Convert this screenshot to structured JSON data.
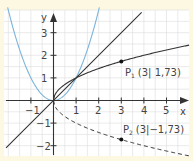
{
  "chart_data": {
    "type": "line",
    "title": "",
    "xlabel": "x",
    "ylabel": "y",
    "xlim": [
      -2.2,
      5.9
    ],
    "ylim": [
      -2.4,
      3.9
    ],
    "grid": true,
    "x_ticks": [
      -1,
      1,
      2,
      3,
      4,
      5
    ],
    "x_tick_labels": [
      "−1",
      "1",
      "2",
      "3",
      "4",
      "5"
    ],
    "y_ticks": [
      3,
      2,
      1,
      -1,
      -2
    ],
    "y_tick_labels": [
      "3",
      "2",
      "1",
      "−1",
      "−2"
    ],
    "series": [
      {
        "name": "y = x²",
        "color": "#7ab4dc",
        "style": "solid",
        "expr": "x^2"
      },
      {
        "name": "y = x",
        "color": "#333333",
        "style": "solid",
        "expr": "x"
      },
      {
        "name": "y = √x",
        "color": "#333333",
        "style": "solid",
        "expr": "sqrt(x)"
      },
      {
        "name": "y = −√x",
        "color": "#333333",
        "style": "dashed",
        "expr": "-sqrt(x)"
      }
    ],
    "points": [
      {
        "name": "P1",
        "x": 3,
        "y": 1.73,
        "label": "(3| 1,73)"
      },
      {
        "name": "P2",
        "x": 3,
        "y": -1.73,
        "label": "(3|−1,73)"
      }
    ]
  },
  "labels": {
    "x_axis": "x",
    "y_axis": "y",
    "p1_name": "P",
    "p1_sub": "1",
    "p1_coords": "(3| 1,73)",
    "p2_name": "P",
    "p2_sub": "2",
    "p2_coords": "(3|−1,73)",
    "ticks_x": [
      "−1",
      "1",
      "2",
      "3",
      "4",
      "5"
    ],
    "ticks_y": [
      "3",
      "2",
      "1",
      "−1",
      "−2"
    ]
  },
  "colors": {
    "background": "#fdf8e2",
    "plot_area": "#ffffff",
    "grid": "#d9d9d9",
    "axis": "#333333",
    "parabola": "#7ab4dc"
  }
}
